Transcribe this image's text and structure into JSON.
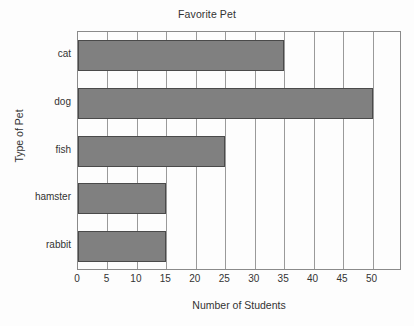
{
  "chart_data": {
    "type": "bar",
    "orientation": "horizontal",
    "title": "Favorite Pet",
    "xlabel": "Number of Students",
    "ylabel": "Type of Pet",
    "categories": [
      "cat",
      "dog",
      "fish",
      "hamster",
      "rabbit"
    ],
    "values": [
      35,
      50,
      25,
      15,
      15
    ],
    "xlim": [
      0,
      55
    ],
    "xticks": [
      0,
      5,
      10,
      15,
      20,
      25,
      30,
      35,
      40,
      45,
      50
    ],
    "xtick_labels": [
      "0",
      "5",
      "10",
      "15",
      "20",
      "25",
      "30",
      "35",
      "40",
      "45",
      "50"
    ],
    "grid": true,
    "grid_axis": "x",
    "legend": false,
    "bar_color": "#808080",
    "bar_edge_color": "#4a4a4a",
    "axis_color": "#8a8a8a",
    "grid_color": "#9a9a9a",
    "background_color": "#fdfdfd",
    "text_color": "#333333"
  }
}
